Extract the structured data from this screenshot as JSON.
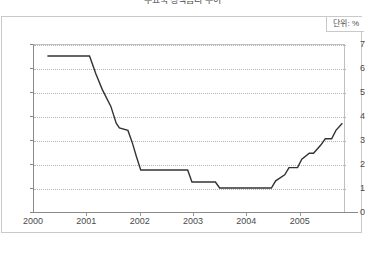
{
  "title": "주요국 정책금리 추이",
  "unit_label": "단위: %",
  "chart_data": {
    "type": "line",
    "title": "주요국 정책금리 추이",
    "xlabel": "",
    "ylabel": "",
    "unit": "%",
    "xlim": [
      2000.0,
      2005.85
    ],
    "ylim": [
      0,
      7
    ],
    "yticks": [
      0,
      1,
      2,
      3,
      4,
      5,
      6,
      7
    ],
    "xticks": [
      2000,
      2001,
      2002,
      2003,
      2004,
      2005
    ],
    "grid": true,
    "grid_style": "dotted-horizontal",
    "legend": "none",
    "line_color": "#333333",
    "series": [
      {
        "name": "정책금리",
        "x": [
          2000.27,
          2000.75,
          2001.06,
          2001.18,
          2001.3,
          2001.46,
          2001.56,
          2001.62,
          2001.78,
          2001.86,
          2001.94,
          2002.02,
          2002.9,
          2002.98,
          2003.42,
          2003.5,
          2004.47,
          2004.55,
          2004.72,
          2004.8,
          2004.96,
          2005.04,
          2005.18,
          2005.26,
          2005.4,
          2005.48,
          2005.6,
          2005.68,
          2005.8
        ],
        "y": [
          6.5,
          6.5,
          6.5,
          5.75,
          5.1,
          4.4,
          3.7,
          3.5,
          3.4,
          2.9,
          2.3,
          1.75,
          1.75,
          1.25,
          1.25,
          1.0,
          1.0,
          1.3,
          1.55,
          1.85,
          1.85,
          2.2,
          2.45,
          2.45,
          2.8,
          3.05,
          3.05,
          3.4,
          3.7
        ]
      }
    ],
    "annotations": [
      {
        "text": "단위: %",
        "position": "top-right"
      }
    ]
  }
}
